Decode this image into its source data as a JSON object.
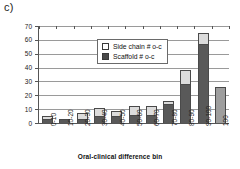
{
  "panel": {
    "label": "c)"
  },
  "chart_data": {
    "type": "bar",
    "title": "",
    "xlabel": "Oral-clinical difference bin",
    "ylabel": "",
    "ylim": [
      0,
      70
    ],
    "yticks": [
      0,
      10,
      20,
      30,
      40,
      50,
      60,
      70
    ],
    "grid": true,
    "stacked": true,
    "legend_position": "inside-top-center",
    "categories": [
      "0-10",
      "10-20",
      "20-30",
      "30-40",
      "40-50",
      "50-60",
      "60-70",
      "70-80",
      "80-90",
      "90-100",
      "100"
    ],
    "series": [
      {
        "name": "Scaffold # o-c",
        "color": "#595959",
        "values": [
          3,
          3,
          3,
          5,
          5,
          6,
          6,
          14,
          28,
          57,
          0
        ]
      },
      {
        "name": "Side chain # o-c",
        "color": "#dcdcdc",
        "values": [
          2,
          0,
          4,
          6,
          4,
          6,
          6,
          2,
          10,
          8,
          0
        ]
      },
      {
        "name": "100 bin total",
        "color": "#9e9e9e",
        "values": [
          0,
          0,
          0,
          0,
          0,
          0,
          0,
          0,
          0,
          0,
          26
        ]
      }
    ],
    "totals": [
      5,
      3,
      7,
      11,
      9,
      12,
      12,
      16,
      38,
      65,
      26
    ]
  },
  "legend": {
    "entries": [
      {
        "label": "Side chain # o-c",
        "swatch": "open-square-icon"
      },
      {
        "label": "Scaffold # o-c",
        "swatch": "filled-square-icon"
      }
    ]
  }
}
